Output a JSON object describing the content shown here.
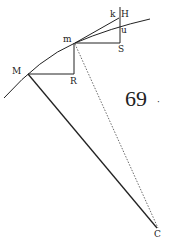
{
  "figure": {
    "number_label": "69",
    "number_suffix": "·",
    "points": {
      "M": "M",
      "m": "m",
      "R": "R",
      "S": "S",
      "H": "H",
      "k": "k",
      "u": "u",
      "C": "C"
    },
    "colors": {
      "ink": "#222222",
      "paper": "#ffffff"
    }
  }
}
